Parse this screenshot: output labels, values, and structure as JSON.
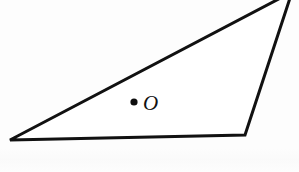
{
  "figure": {
    "kind": "geometry-diagram",
    "background_color": "#fdfdfd",
    "stroke_color": "#111111",
    "fill_color": "#ffffff",
    "stroke_width": 3,
    "canvas": {
      "width": 299,
      "height": 172
    },
    "shape": {
      "name": "triangle",
      "vertices": [
        {
          "id": "left",
          "x": 10,
          "y": 140
        },
        {
          "id": "bottom-right",
          "x": 245,
          "y": 135
        },
        {
          "id": "apex",
          "x": 292,
          "y": -8,
          "clipped_by_top_edge": true
        }
      ],
      "path": "M 10 140 L 245 135 L 292 -8 Z"
    },
    "point": {
      "label": "O",
      "marker": "filled-dot",
      "marker_color": "#0d0d0d",
      "center": {
        "x": 134,
        "y": 102
      },
      "radius": 3.6,
      "label_position": {
        "x": 143,
        "y": 110
      },
      "label_font_size": 21,
      "label_style": "italic"
    }
  }
}
